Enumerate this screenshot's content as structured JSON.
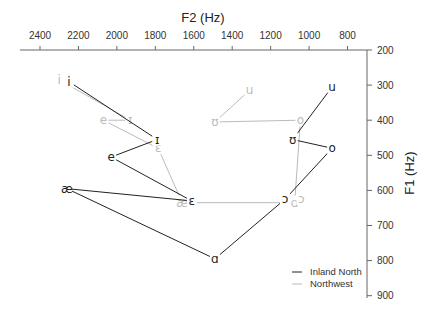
{
  "chart_data": {
    "type": "scatter",
    "title": "",
    "xlabel": "F2 (Hz)",
    "ylabel": "F1 (Hz)",
    "x_axis": {
      "position": "top",
      "reversed": true,
      "range": [
        2500,
        700
      ],
      "ticks": [
        2400,
        2200,
        2000,
        1800,
        1600,
        1400,
        1200,
        1000,
        800
      ]
    },
    "y_axis": {
      "position": "right",
      "reversed": true,
      "range": [
        200,
        900
      ],
      "ticks": [
        200,
        300,
        400,
        500,
        600,
        700,
        800,
        900
      ]
    },
    "grid": false,
    "legend_position": "bottom-right",
    "series": [
      {
        "name": "Inland North",
        "color": "#222222",
        "points": [
          {
            "vowel": "i",
            "F2": 2250,
            "F1": 290
          },
          {
            "vowel": "ɪ",
            "F2": 1790,
            "F1": 455
          },
          {
            "vowel": "e",
            "F2": 2030,
            "F1": 505
          },
          {
            "vowel": "ɛ",
            "F2": 1610,
            "F1": 630
          },
          {
            "vowel": "æ",
            "F2": 2260,
            "F1": 595
          },
          {
            "vowel": "ɑ",
            "F2": 1490,
            "F1": 795
          },
          {
            "vowel": "ɔ",
            "F2": 1125,
            "F1": 625
          },
          {
            "vowel": "o",
            "F2": 880,
            "F1": 480
          },
          {
            "vowel": "ʊ",
            "F2": 1085,
            "F1": 455
          },
          {
            "vowel": "u",
            "F2": 880,
            "F1": 305
          }
        ],
        "segments": [
          [
            "i",
            "ɪ"
          ],
          [
            "ɪ",
            "e"
          ],
          [
            "e",
            "ɛ"
          ],
          [
            "ɛ",
            "æ"
          ],
          [
            "æ",
            "ɑ"
          ],
          [
            "ɑ",
            "ɔ"
          ],
          [
            "ɔ",
            "o"
          ],
          [
            "o",
            "ʊ"
          ],
          [
            "ʊ",
            "u"
          ]
        ]
      },
      {
        "name": "Northwest",
        "color": "#bbbbbb",
        "points": [
          {
            "vowel": "i",
            "F2": 2300,
            "F1": 285
          },
          {
            "vowel": "e",
            "F2": 2070,
            "F1": 400
          },
          {
            "vowel": "ɪ",
            "F2": 1930,
            "F1": 400
          },
          {
            "vowel": "ɛ",
            "F2": 1785,
            "F1": 480
          },
          {
            "vowel": "æ",
            "F2": 1660,
            "F1": 635
          },
          {
            "vowel": "ɑ",
            "F2": 1075,
            "F1": 635
          },
          {
            "vowel": "ɔ",
            "F2": 1040,
            "F1": 625
          },
          {
            "vowel": "o",
            "F2": 1045,
            "F1": 400
          },
          {
            "vowel": "ʊ",
            "F2": 1490,
            "F1": 405
          },
          {
            "vowel": "u",
            "F2": 1310,
            "F1": 315
          }
        ],
        "segments": [
          [
            "i",
            "ɪ"
          ],
          [
            "e",
            "ɪ"
          ],
          [
            "e",
            "ɛ"
          ],
          [
            "ɛ",
            "æ"
          ],
          [
            "æ",
            "ɑ"
          ],
          [
            "ɑ",
            "o"
          ],
          [
            "o",
            "ʊ"
          ],
          [
            "ʊ",
            "u"
          ]
        ]
      }
    ]
  },
  "legend": {
    "items": [
      {
        "label": "Inland North",
        "color": "#222222"
      },
      {
        "label": "Northwest",
        "color": "#bbbbbb"
      }
    ]
  }
}
